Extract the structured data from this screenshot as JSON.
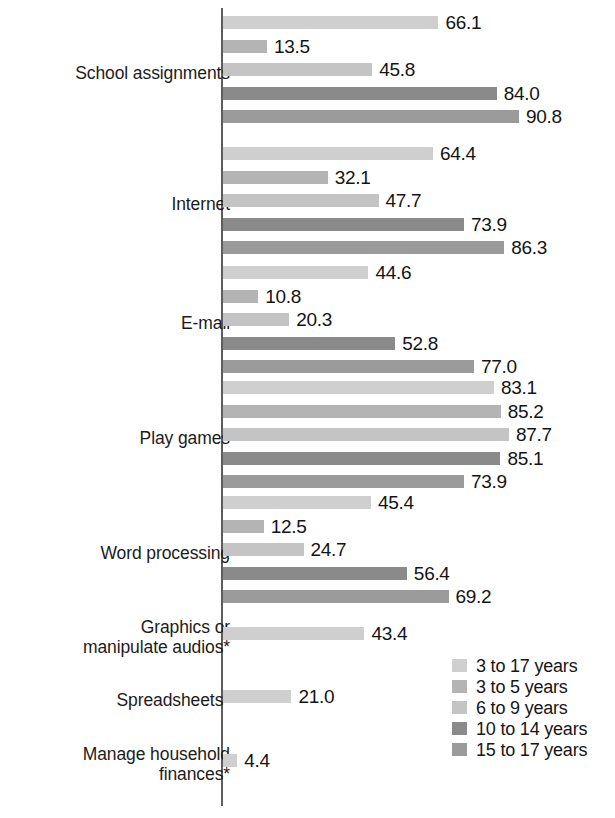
{
  "chart_data": {
    "type": "bar",
    "orientation": "horizontal",
    "title": "",
    "subtitle": "",
    "xlabel": "",
    "ylabel": "",
    "xlim": [
      0,
      100
    ],
    "grid": false,
    "legend_position": "bottom-right",
    "value_label_format": "one-decimal",
    "categories": [
      "School assignments",
      "Internet",
      "E-mail",
      "Play games",
      "Word processing",
      "Graphics or\nmanipulate audios*",
      "Spreadsheets*",
      "Manage household\nfinances*"
    ],
    "series": [
      {
        "name": "3 to 17 years",
        "color": "#cfcfcf",
        "values": [
          66.1,
          64.4,
          44.6,
          83.1,
          45.4,
          43.4,
          21.0,
          4.4
        ]
      },
      {
        "name": "3 to 5 years",
        "color": "#b4b4b4",
        "values": [
          13.5,
          32.1,
          10.8,
          85.2,
          12.5,
          null,
          null,
          null
        ]
      },
      {
        "name": "6 to 9 years",
        "color": "#c4c4c4",
        "values": [
          45.8,
          47.7,
          20.3,
          87.7,
          24.7,
          null,
          null,
          null
        ]
      },
      {
        "name": "10 to 14 years",
        "color": "#8a8a8a",
        "values": [
          84.0,
          73.9,
          52.8,
          85.1,
          56.4,
          null,
          null,
          null
        ]
      },
      {
        "name": "15 to 17 years",
        "color": "#9b9b9b",
        "values": [
          90.8,
          86.3,
          77.0,
          73.9,
          69.2,
          null,
          null,
          null
        ]
      }
    ],
    "value_labels": [
      [
        "66.1",
        "13.5",
        "45.8",
        "84.0",
        "90.8"
      ],
      [
        "64.4",
        "32.1",
        "47.7",
        "73.9",
        "86.3"
      ],
      [
        "44.6",
        "10.8",
        "20.3",
        "52.8",
        "77.0"
      ],
      [
        "83.1",
        "85.2",
        "87.7",
        "85.1",
        "73.9"
      ],
      [
        "45.4",
        "12.5",
        "24.7",
        "56.4",
        "69.2"
      ],
      [
        "43.4"
      ],
      [
        "21.0"
      ],
      [
        "4.4"
      ]
    ]
  },
  "legend": {
    "items": [
      {
        "label": "3 to 17 years",
        "color": "#cfcfcf"
      },
      {
        "label": "3 to 5 years",
        "color": "#b4b4b4"
      },
      {
        "label": "6 to 9 years",
        "color": "#c4c4c4"
      },
      {
        "label": "10 to 14 years",
        "color": "#8a8a8a"
      },
      {
        "label": "15 to 17 years",
        "color": "#9b9b9b"
      }
    ]
  }
}
